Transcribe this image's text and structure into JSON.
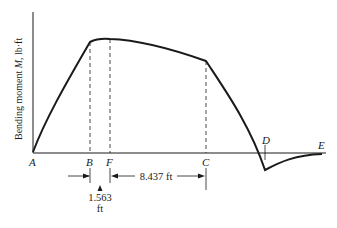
{
  "diagram": {
    "type": "bending-moment-diagram",
    "y_axis_label": "Bending moment M, lb·ft",
    "y_axis_label_parts": {
      "prefix": "Bending moment ",
      "symbol": "M",
      "suffix": ", lb·ft"
    },
    "points": [
      {
        "label": "A"
      },
      {
        "label": "B"
      },
      {
        "label": "F"
      },
      {
        "label": "C"
      },
      {
        "label": "D"
      },
      {
        "label": "E"
      }
    ],
    "dimensions": [
      {
        "from": "B",
        "to": "F",
        "value": "1.563",
        "unit": "ft"
      },
      {
        "from": "F",
        "to": "C",
        "value": "8.437 ft"
      }
    ],
    "colors": {
      "line": "#1a1a1a",
      "background": "#ffffff"
    }
  }
}
